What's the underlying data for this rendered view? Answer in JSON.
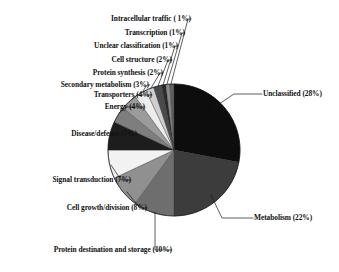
{
  "chart_data": {
    "type": "pie",
    "title": "",
    "xlabel": "",
    "ylabel": "",
    "legend_position": "none",
    "grid": false,
    "units": "percent",
    "total": 100,
    "start_angle_deg": 0,
    "direction": "clockwise",
    "categories": [
      "Unclassified",
      "Metabolism",
      "Protein destination and storage",
      "Cell growth/division",
      "Signal transduction",
      "Disease/defense",
      "Energy",
      "Transporters",
      "Secondary metabolism",
      "Protein synthesis",
      "Cell structure",
      "Unclear classification",
      "Transcription",
      "Intracellular traffic"
    ],
    "values": [
      28,
      22,
      10,
      8,
      7,
      7,
      4,
      4,
      3,
      2,
      2,
      1,
      1,
      1
    ],
    "labels": [
      "Unclassified (28%)",
      "Metabolism (22%)",
      "Protein destination and storage (10%)",
      "Cell growth/division (8%)",
      "Signal transduction (7%)",
      "Disease/defense (7%)",
      "Energy (4%)",
      "Transporters (4%)",
      "Secondary metabolism (3%)",
      "Protein synthesis (2%)",
      "Cell structure (2%)",
      "Unclear classification (1%)",
      "Transcription (1%)",
      "Intracellular traffic ( 1%)"
    ],
    "colors": [
      "#0d0d0d",
      "#3c3c3c",
      "#6e6e6e",
      "#909090",
      "#f2f2f2",
      "#1d1d1d",
      "#7e7e7e",
      "#9b9b9b",
      "#ededed",
      "#cfcfcf",
      "#4a4a4a",
      "#2a2a2a",
      "#8a8a8a",
      "#5e5e5e"
    ]
  },
  "slices": {
    "unclassified": {
      "label": "Unclassified (28%)",
      "value": 28,
      "color": "#0d0d0d"
    },
    "metabolism": {
      "label": "Metabolism (22%)",
      "value": 22,
      "color": "#3c3c3c"
    },
    "protein_destination": {
      "label": "Protein destination and storage (10%)",
      "value": 10,
      "color": "#6e6e6e"
    },
    "cell_growth": {
      "label": "Cell growth/division (8%)",
      "value": 8,
      "color": "#909090"
    },
    "signal_transduction": {
      "label": "Signal transduction (7%)",
      "value": 7,
      "color": "#f2f2f2"
    },
    "disease_defense": {
      "label": "Disease/defense (7%)",
      "value": 7,
      "color": "#1d1d1d"
    },
    "energy": {
      "label": "Energy (4%)",
      "value": 4,
      "color": "#7e7e7e"
    },
    "transporters": {
      "label": "Transporters (4%)",
      "value": 4,
      "color": "#9b9b9b"
    },
    "secondary_metabolism": {
      "label": "Secondary metabolism (3%)",
      "value": 3,
      "color": "#ededed"
    },
    "protein_synthesis": {
      "label": "Protein synthesis (2%)",
      "value": 2,
      "color": "#cfcfcf"
    },
    "cell_structure": {
      "label": "Cell structure (2%)",
      "value": 2,
      "color": "#4a4a4a"
    },
    "unclear_classification": {
      "label": "Unclear classification (1%)",
      "value": 1,
      "color": "#2a2a2a"
    },
    "transcription": {
      "label": "Transcription (1%)",
      "value": 1,
      "color": "#8a8a8a"
    },
    "intracellular_traffic": {
      "label": "Intracellular traffic ( 1%)",
      "value": 1,
      "color": "#5e5e5e"
    }
  }
}
